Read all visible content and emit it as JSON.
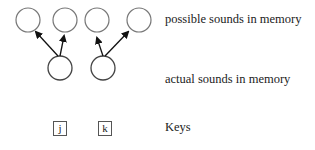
{
  "labels": {
    "possible": "possible sounds in memory",
    "actual": "actual sounds in memory",
    "keys": "Keys"
  },
  "keys": [
    {
      "label": "j"
    },
    {
      "label": "k"
    }
  ],
  "colors": {
    "circle_stroke": "#777777",
    "arrow": "#111111",
    "text": "#222222"
  }
}
